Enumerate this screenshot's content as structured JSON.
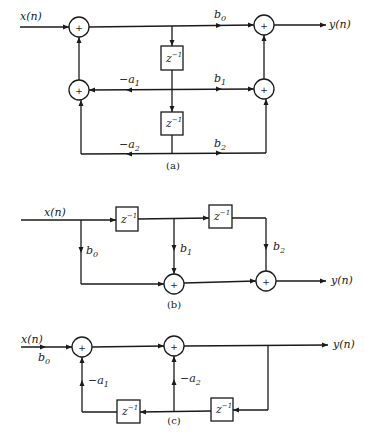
{
  "figure": {
    "type": "signal-flow block diagrams",
    "panels": [
      {
        "caption": "(a)",
        "structure": "direct form II second-order section",
        "input_label": "x(n)",
        "output_label": "y(n)",
        "delay_label": "z",
        "delay_exp": "−1",
        "gains": [
          {
            "name": "b",
            "sub": "0"
          },
          {
            "name": "b",
            "sub": "1"
          },
          {
            "name": "b",
            "sub": "2"
          },
          {
            "name": "-a",
            "sub": "1"
          },
          {
            "name": "-a",
            "sub": "2"
          }
        ],
        "summer_symbol": "+"
      },
      {
        "caption": "(b)",
        "structure": "FIR (all-zero) second-order section",
        "input_label": "x(n)",
        "output_label": "y(n)",
        "delay_label": "z",
        "delay_exp": "−1",
        "gains": [
          {
            "name": "b",
            "sub": "0"
          },
          {
            "name": "b",
            "sub": "1"
          },
          {
            "name": "b",
            "sub": "2"
          }
        ],
        "summer_symbol": "+"
      },
      {
        "caption": "(c)",
        "structure": "all-pole second-order section",
        "input_label": "x(n)",
        "output_label": "y(n)",
        "delay_label": "z",
        "delay_exp": "−1",
        "gains": [
          {
            "name": "b",
            "sub": "0"
          },
          {
            "name": "-a",
            "sub": "1"
          },
          {
            "name": "-a",
            "sub": "2"
          }
        ],
        "summer_symbol": "+"
      }
    ]
  },
  "colors": {
    "line": "#1a1a1a",
    "background": "#ffffff"
  }
}
